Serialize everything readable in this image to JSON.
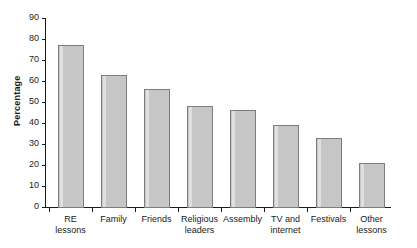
{
  "chart_data": {
    "type": "bar",
    "title": "",
    "xlabel": "",
    "ylabel": "Percentage",
    "ylim": [
      0,
      90
    ],
    "ytick_step": 10,
    "yticks": [
      0,
      10,
      20,
      30,
      40,
      50,
      60,
      70,
      80,
      90
    ],
    "ytick_labels": [
      "0",
      "10",
      "20",
      "30",
      "40",
      "50",
      "60",
      "70",
      "80",
      "90"
    ],
    "grid": false,
    "legend": "none",
    "categories": [
      "RE lessons",
      "Family",
      "Friends",
      "Religious\nleaders",
      "Assembly",
      "TV and\ninternet",
      "Festivals",
      "Other\nlessons"
    ],
    "values": [
      77,
      63,
      56,
      48,
      46,
      39,
      33,
      21
    ],
    "bar_fill_color": "#c6c6c6",
    "bar_border_color": "#7d7d7d",
    "axis_color": "#1a1a1a",
    "background_color": "#ffffff"
  },
  "axis": {
    "y_title": "Percentage"
  }
}
